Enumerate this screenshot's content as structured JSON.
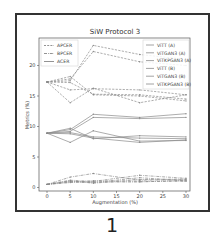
{
  "chart_data": {
    "type": "line",
    "title": "SiW Protocol 3",
    "xlabel": "Augmentation (%)",
    "ylabel": "Metrics (%)",
    "x": [
      0,
      5,
      10,
      20,
      30
    ],
    "xticks": [
      0,
      5,
      10,
      15,
      20,
      25,
      30
    ],
    "yticks": [
      0,
      5,
      10,
      15,
      20
    ],
    "xlim": [
      -1.5,
      31.5
    ],
    "ylim": [
      -0.5,
      25
    ],
    "grid": false,
    "metric_legend": {
      "position": "upper left",
      "entries": [
        {
          "label": "APCER",
          "style": "dashed"
        },
        {
          "label": "BPCER",
          "style": "dashdot"
        },
        {
          "label": "ACER",
          "style": "solid"
        }
      ]
    },
    "model_legend": {
      "position": "upper right",
      "entries": [
        "ViTT (A)",
        "ViTGAN3 (A)",
        "ViTKPGAN3 (A)",
        "ViTT (B)",
        "ViTGAN3 (B)",
        "ViTKPGAN3 (B)"
      ]
    },
    "series": [
      {
        "name": "ViTT (A)",
        "metric": "APCER",
        "values": [
          17.3,
          17.5,
          23.3,
          21.8,
          21.0
        ]
      },
      {
        "name": "ViTGAN3 (A)",
        "metric": "APCER",
        "values": [
          17.3,
          17.8,
          22.3,
          20.6,
          20.0
        ]
      },
      {
        "name": "ViTKPGAN3 (A)",
        "metric": "APCER",
        "values": [
          17.3,
          16.0,
          16.2,
          16.0,
          15.2
        ]
      },
      {
        "name": "ViTT (B)",
        "metric": "APCER",
        "values": [
          17.3,
          13.9,
          16.3,
          13.9,
          15.2
        ]
      },
      {
        "name": "ViTGAN3 (B)",
        "metric": "APCER",
        "values": [
          17.3,
          18.2,
          15.2,
          15.0,
          14.2
        ]
      },
      {
        "name": "ViTKPGAN3 (B)",
        "metric": "APCER",
        "values": [
          17.3,
          17.2,
          15.3,
          15.2,
          14.5
        ]
      },
      {
        "name": "ViTT (A)",
        "metric": "BPCER",
        "values": [
          0.5,
          1.7,
          2.3,
          1.2,
          1.3
        ]
      },
      {
        "name": "ViTGAN3 (A)",
        "metric": "BPCER",
        "values": [
          0.5,
          1.2,
          1.0,
          2.0,
          1.5
        ]
      },
      {
        "name": "ViTKPGAN3 (A)",
        "metric": "BPCER",
        "values": [
          0.5,
          0.9,
          0.9,
          0.9,
          1.2
        ]
      },
      {
        "name": "ViTT (B)",
        "metric": "BPCER",
        "values": [
          0.5,
          1.0,
          0.8,
          1.6,
          1.1
        ]
      },
      {
        "name": "ViTGAN3 (B)",
        "metric": "BPCER",
        "values": [
          0.5,
          0.8,
          1.1,
          1.0,
          1.0
        ]
      },
      {
        "name": "ViTKPGAN3 (B)",
        "metric": "BPCER",
        "values": [
          0.5,
          1.1,
          0.7,
          1.3,
          1.4
        ]
      },
      {
        "name": "ViTT (A)",
        "metric": "ACER",
        "values": [
          8.9,
          9.5,
          12.0,
          11.5,
          12.1
        ]
      },
      {
        "name": "ViTGAN3 (A)",
        "metric": "ACER",
        "values": [
          8.9,
          9.2,
          11.5,
          11.3,
          11.5
        ]
      },
      {
        "name": "ViTKPGAN3 (A)",
        "metric": "ACER",
        "values": [
          8.9,
          7.4,
          9.3,
          7.6,
          7.7
        ]
      },
      {
        "name": "ViTT (B)",
        "metric": "ACER",
        "values": [
          8.9,
          9.7,
          8.0,
          8.5,
          8.3
        ]
      },
      {
        "name": "ViTGAN3 (B)",
        "metric": "ACER",
        "values": [
          8.9,
          9.0,
          8.3,
          8.1,
          8.0
        ]
      },
      {
        "name": "ViTKPGAN3 (B)",
        "metric": "ACER",
        "values": [
          8.9,
          8.8,
          8.1,
          7.4,
          7.8
        ]
      }
    ]
  },
  "caption": {
    "figure_number": "1"
  },
  "colors": {
    "line": "#8a8a8a",
    "axis": "#555555",
    "frame": "#333333"
  }
}
